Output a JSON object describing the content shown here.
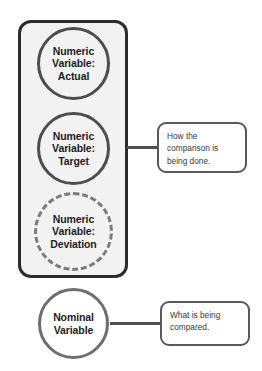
{
  "diagram": {
    "group": {
      "name": "numeric-variable-group",
      "fill_color": "#f2f2f2",
      "border_color": "#2b2b2b"
    },
    "nodes": [
      {
        "id": "actual",
        "lines": [
          "Numeric",
          "Variable:",
          "Actual"
        ],
        "border_style": "solid",
        "border_color": "#4d4d4d",
        "in_group": true
      },
      {
        "id": "target",
        "lines": [
          "Numeric",
          "Variable:",
          "Target"
        ],
        "border_style": "solid",
        "border_color": "#4d4d4d",
        "in_group": true
      },
      {
        "id": "deviation",
        "lines": [
          "Numeric",
          "Variable:",
          "Deviation"
        ],
        "border_style": "dashed",
        "border_color": "#7b7b7b",
        "in_group": true
      },
      {
        "id": "nominal",
        "lines": [
          "Nominal",
          "Variable"
        ],
        "border_style": "solid",
        "border_color": "#6e6e6e",
        "in_group": false
      }
    ],
    "callouts": [
      {
        "id": "how",
        "text": "How the\ncomparison is\nbeing done.",
        "connects_to": "numeric-variable-group",
        "border_color": "#595959"
      },
      {
        "id": "what",
        "text": "What is being\ncompared.",
        "connects_to": "nominal",
        "border_color": "#595959"
      }
    ],
    "connectors": [
      {
        "id": "group-to-how",
        "color": "#4f4f4f"
      },
      {
        "id": "nominal-to-what",
        "color": "#4f4f4f"
      }
    ]
  }
}
